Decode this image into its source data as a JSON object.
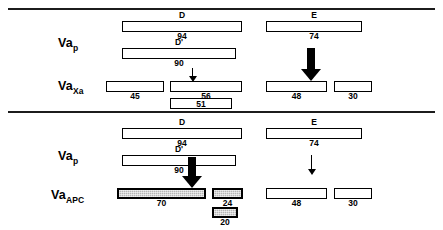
{
  "diagram": {
    "type": "protein-cleavage-map",
    "colors": {
      "line": "#000000",
      "fill_plain": "#ffffff",
      "fill_shaded": "#b4b4b4"
    },
    "panels": [
      {
        "id": "xa",
        "rows": [
          {
            "id": "vap-top",
            "label_base": "Va",
            "label_sub": "p",
            "bars": [
              {
                "id": "d-top",
                "domain": "D",
                "value": "94",
                "shaded": false
              },
              {
                "id": "e-top",
                "domain": "E",
                "value": "74",
                "shaded": false
              },
              {
                "id": "dp-top",
                "domain": "D'",
                "value": "90",
                "shaded": false
              }
            ]
          },
          {
            "id": "vaxa",
            "label_base": "Va",
            "label_sub": "Xa",
            "bars": [
              {
                "id": "xa-45",
                "domain": "",
                "value": "45",
                "shaded": false
              },
              {
                "id": "xa-56",
                "domain": "",
                "value": "56",
                "shaded": false
              },
              {
                "id": "xa-51",
                "domain": "",
                "value": "51",
                "shaded": false
              },
              {
                "id": "xa-48",
                "domain": "",
                "value": "48",
                "shaded": false
              },
              {
                "id": "xa-30",
                "domain": "",
                "value": "30",
                "shaded": false
              }
            ]
          }
        ],
        "arrows": [
          {
            "id": "xa-arrow-heavy-chain",
            "style": "thin",
            "position": "left"
          },
          {
            "id": "xa-arrow-light-chain",
            "style": "thick",
            "position": "right"
          }
        ]
      },
      {
        "id": "apc",
        "rows": [
          {
            "id": "vap-bottom",
            "label_base": "Va",
            "label_sub": "p",
            "bars": [
              {
                "id": "d-bot",
                "domain": "D",
                "value": "94",
                "shaded": false
              },
              {
                "id": "e-bot",
                "domain": "E",
                "value": "74",
                "shaded": false
              },
              {
                "id": "dp-bot",
                "domain": "D'",
                "value": "90",
                "shaded": false
              }
            ]
          },
          {
            "id": "vaapc",
            "label_base": "Va",
            "label_sub": "APC",
            "bars": [
              {
                "id": "apc-70",
                "domain": "",
                "value": "70",
                "shaded": true
              },
              {
                "id": "apc-24",
                "domain": "",
                "value": "24",
                "shaded": true
              },
              {
                "id": "apc-20",
                "domain": "",
                "value": "20",
                "shaded": true
              },
              {
                "id": "apc-48",
                "domain": "",
                "value": "48",
                "shaded": false
              },
              {
                "id": "apc-30",
                "domain": "",
                "value": "30",
                "shaded": false
              }
            ]
          }
        ],
        "arrows": [
          {
            "id": "apc-arrow-heavy-chain",
            "style": "thick",
            "position": "left"
          },
          {
            "id": "apc-arrow-light-chain",
            "style": "thin",
            "position": "right"
          }
        ]
      }
    ]
  }
}
